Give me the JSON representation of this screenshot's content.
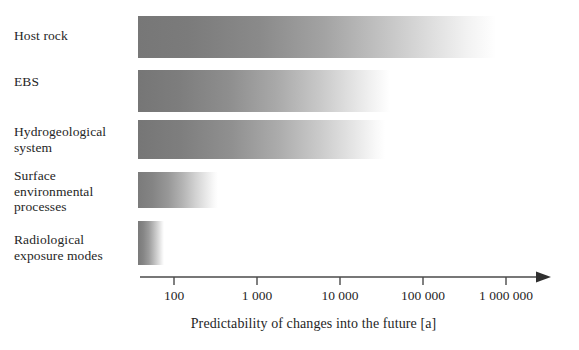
{
  "figure": {
    "title_none": "",
    "background_color": "#ffffff",
    "bar_start_color": "#7a7a7a",
    "bar_end_color": "#ffffff",
    "axis_color": "#4a4a4a",
    "text_color": "#1f1f1f"
  },
  "categories": [
    {
      "label": "Host rock"
    },
    {
      "label": "EBS"
    },
    {
      "label": "Hydrogeological\nsystem"
    },
    {
      "label": "Surface\nenvironmental\nprocesses"
    },
    {
      "label": "Radiological\nexposure modes"
    }
  ],
  "axis": {
    "label": "Predictability of changes into the future [a]",
    "scale": "log10",
    "ticks": [
      "100",
      "1 000",
      "10 000",
      "100 000",
      "1 000 000"
    ],
    "arrow_icon": "arrow-right-icon"
  },
  "chart_data": {
    "type": "bar",
    "title": "",
    "subtitle": "",
    "xlabel": "Predictability of changes into the future [a]",
    "ylabel": "",
    "orientation": "horizontal",
    "xscale": "log10",
    "xlim": [
      30,
      3000000
    ],
    "xticks": [
      100,
      1000,
      10000,
      100000,
      1000000
    ],
    "xticklabels": [
      "100",
      "1 000",
      "10 000",
      "100 000",
      "1 000 000"
    ],
    "grid": false,
    "legend": "none",
    "note": "Each bar is a left-to-right gradient from solid grey to white; the fade-out point encodes the time horizon beyond which predictability is lost.",
    "categories": [
      "Host rock",
      "EBS",
      "Hydrogeological system",
      "Surface environmental processes",
      "Radiological exposure modes"
    ],
    "series": [
      {
        "name": "Solid start of bar (years)",
        "values": [
          50,
          50,
          50,
          50,
          50
        ]
      },
      {
        "name": "Fade-out end of bar (years)",
        "values": [
          1000000,
          50000,
          40000,
          700,
          110
        ]
      }
    ],
    "bars_px": [
      {
        "category": "Host rock",
        "x": 138,
        "y": 16,
        "width": 358,
        "height": 42
      },
      {
        "category": "EBS",
        "x": 138,
        "y": 70,
        "width": 252,
        "height": 42
      },
      {
        "category": "Hydrogeological system",
        "x": 138,
        "y": 120,
        "width": 247,
        "height": 39
      },
      {
        "category": "Surface environmental processes",
        "x": 138,
        "y": 172,
        "width": 80,
        "height": 36
      },
      {
        "category": "Radiological exposure modes",
        "x": 138,
        "y": 221,
        "width": 26,
        "height": 44
      }
    ],
    "label_positions_px": [
      {
        "label": "Host rock",
        "top": 28
      },
      {
        "label": "Hydrogeological\nsystem",
        "top": 124
      },
      {
        "label": "EBS",
        "top": 74
      },
      {
        "label": "Surface\nenvironmental\nprocesses",
        "top": 168
      },
      {
        "label": "Radiological\nexposure modes",
        "top": 232
      }
    ]
  }
}
